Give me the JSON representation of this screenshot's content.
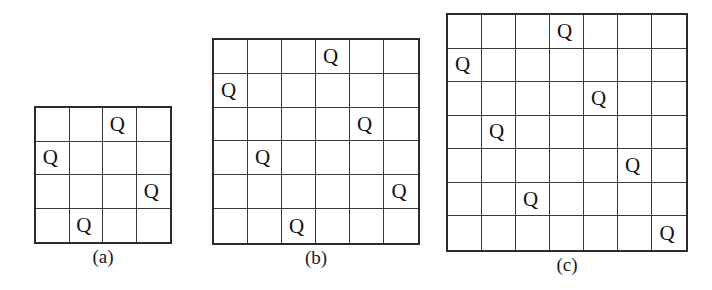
{
  "figure": {
    "background_color": "#ffffff",
    "line_color": "#3a3a3a",
    "border_color": "#2b2b2b",
    "queen_glyph": "Q",
    "cell_size_px": 34.5
  },
  "boards": [
    {
      "id": "board-a",
      "caption": "(a)",
      "size": 4,
      "left": 34,
      "top": 106,
      "pixel_width": 138,
      "pixel_height": 138,
      "caption_top": 246,
      "queens": [
        {
          "row": 0,
          "col": 2
        },
        {
          "row": 1,
          "col": 0
        },
        {
          "row": 2,
          "col": 3
        },
        {
          "row": 3,
          "col": 1
        }
      ]
    },
    {
      "id": "board-b",
      "caption": "(b)",
      "size": 6,
      "left": 212,
      "top": 38,
      "pixel_width": 208,
      "pixel_height": 207,
      "caption_top": 247,
      "queens": [
        {
          "row": 0,
          "col": 3
        },
        {
          "row": 1,
          "col": 0
        },
        {
          "row": 2,
          "col": 4
        },
        {
          "row": 3,
          "col": 1
        },
        {
          "row": 4,
          "col": 5
        },
        {
          "row": 5,
          "col": 2
        }
      ]
    },
    {
      "id": "board-c",
      "caption": "(c)",
      "size": 7,
      "left": 446,
      "top": 13,
      "pixel_width": 242,
      "pixel_height": 239,
      "caption_top": 254,
      "queens": [
        {
          "row": 0,
          "col": 3
        },
        {
          "row": 1,
          "col": 0
        },
        {
          "row": 2,
          "col": 4
        },
        {
          "row": 3,
          "col": 1
        },
        {
          "row": 4,
          "col": 5
        },
        {
          "row": 5,
          "col": 2
        },
        {
          "row": 6,
          "col": 6
        }
      ]
    }
  ]
}
